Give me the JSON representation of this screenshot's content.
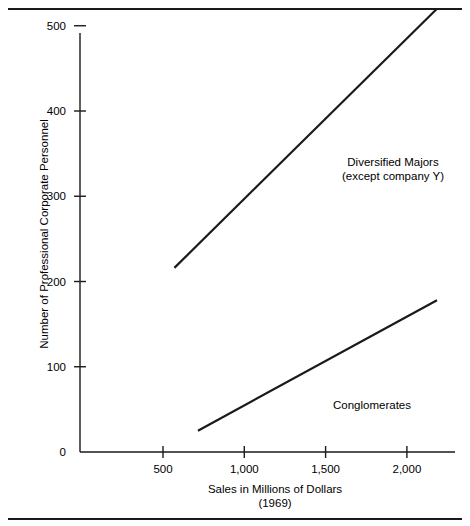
{
  "chart_data": {
    "type": "line",
    "title": "",
    "xlabel": "Sales in Millions of Dollars",
    "xlabel_sub": "(1969)",
    "ylabel": "Number of Professional Corporate Personnel",
    "xlim": [
      0,
      2300
    ],
    "ylim": [
      0,
      540
    ],
    "grid": false,
    "legend_position": "inline-annotation",
    "xticks": [
      500,
      1000,
      1500,
      2000
    ],
    "xtick_labels": [
      "500",
      "1,000",
      "1,500",
      "2,000"
    ],
    "yticks": [
      0,
      100,
      200,
      300,
      400,
      500
    ],
    "ytick_labels": [
      "0",
      "100",
      "200",
      "300",
      "400",
      "500"
    ],
    "series": [
      {
        "name": "Diversified Majors",
        "annotation_line1": "Diversified Majors",
        "annotation_line2": "(except company Y)",
        "x": [
          570,
          2185
        ],
        "values": [
          216,
          520
        ],
        "color": "#1a1a1a"
      },
      {
        "name": "Conglomerates",
        "annotation_line1": "Conglomerates",
        "annotation_line2": "",
        "x": [
          715,
          2185
        ],
        "values": [
          25,
          178
        ],
        "color": "#1a1a1a"
      }
    ]
  },
  "axes": {
    "axis_color": "#1a1a1a",
    "frame_color": "#1a1a1a"
  }
}
